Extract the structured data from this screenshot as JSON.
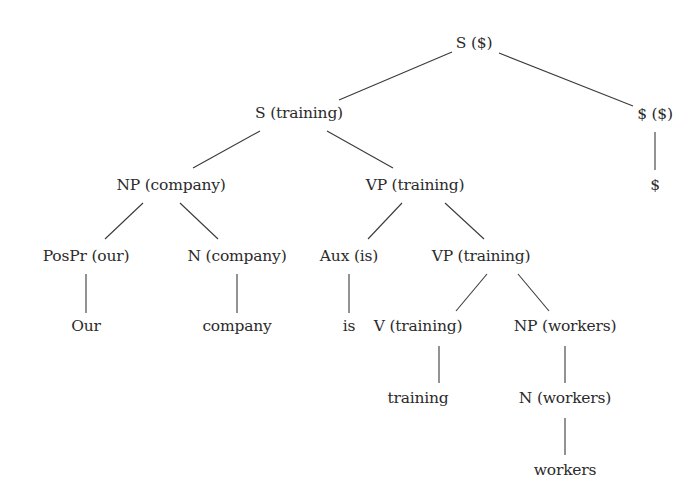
{
  "diagram": {
    "type": "parse-tree",
    "nodes": [
      {
        "id": "s_root",
        "label": "S ($)",
        "x": 474,
        "y": 43
      },
      {
        "id": "s_training",
        "label": "S (training)",
        "x": 299,
        "y": 113
      },
      {
        "id": "dollar_node",
        "label": "$ ($)",
        "x": 655,
        "y": 114
      },
      {
        "id": "dollar_leaf",
        "label": "$",
        "x": 655,
        "y": 185
      },
      {
        "id": "np_company",
        "label": "NP (company)",
        "x": 171,
        "y": 185
      },
      {
        "id": "vp_training_1",
        "label": "VP (training)",
        "x": 415,
        "y": 185
      },
      {
        "id": "pospr_our",
        "label": "PosPr (our)",
        "x": 86,
        "y": 256
      },
      {
        "id": "n_company",
        "label": "N (company)",
        "x": 237,
        "y": 256
      },
      {
        "id": "aux_is",
        "label": "Aux (is)",
        "x": 349,
        "y": 256
      },
      {
        "id": "vp_training_2",
        "label": "VP (training)",
        "x": 481,
        "y": 256
      },
      {
        "id": "our_leaf",
        "label": "Our",
        "x": 86,
        "y": 326
      },
      {
        "id": "company_leaf",
        "label": "company",
        "x": 237,
        "y": 326
      },
      {
        "id": "is_leaf",
        "label": "is",
        "x": 349,
        "y": 326
      },
      {
        "id": "v_training",
        "label": "V (training)",
        "x": 418,
        "y": 326
      },
      {
        "id": "np_workers",
        "label": "NP (workers)",
        "x": 565,
        "y": 326
      },
      {
        "id": "training_leaf",
        "label": "training",
        "x": 418,
        "y": 398
      },
      {
        "id": "n_workers",
        "label": "N (workers)",
        "x": 565,
        "y": 398
      },
      {
        "id": "workers_leaf",
        "label": "workers",
        "x": 565,
        "y": 470
      }
    ],
    "edges": [
      {
        "x1": 452,
        "y1": 52,
        "x2": 339,
        "y2": 100
      },
      {
        "x1": 499,
        "y1": 53,
        "x2": 633,
        "y2": 106
      },
      {
        "x1": 655,
        "y1": 132,
        "x2": 655,
        "y2": 170
      },
      {
        "x1": 260,
        "y1": 131,
        "x2": 193,
        "y2": 168
      },
      {
        "x1": 327,
        "y1": 131,
        "x2": 393,
        "y2": 168
      },
      {
        "x1": 143,
        "y1": 203,
        "x2": 105,
        "y2": 239
      },
      {
        "x1": 180,
        "y1": 203,
        "x2": 218,
        "y2": 239
      },
      {
        "x1": 402,
        "y1": 203,
        "x2": 368,
        "y2": 239
      },
      {
        "x1": 445,
        "y1": 203,
        "x2": 484,
        "y2": 239
      },
      {
        "x1": 86,
        "y1": 274,
        "x2": 86,
        "y2": 313
      },
      {
        "x1": 237,
        "y1": 274,
        "x2": 237,
        "y2": 313
      },
      {
        "x1": 349,
        "y1": 274,
        "x2": 349,
        "y2": 313
      },
      {
        "x1": 487,
        "y1": 274,
        "x2": 456,
        "y2": 311
      },
      {
        "x1": 518,
        "y1": 274,
        "x2": 549,
        "y2": 311
      },
      {
        "x1": 439,
        "y1": 346,
        "x2": 439,
        "y2": 383
      },
      {
        "x1": 565,
        "y1": 346,
        "x2": 565,
        "y2": 383
      },
      {
        "x1": 565,
        "y1": 418,
        "x2": 565,
        "y2": 455
      }
    ]
  }
}
